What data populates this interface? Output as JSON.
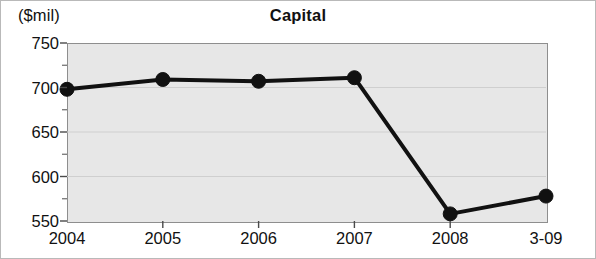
{
  "figure": {
    "unit_label": "($mil)",
    "title": "Capital",
    "width": 596,
    "height": 259,
    "frame_color": "#b9b9b9",
    "plot_background": "#e7e7e7",
    "plot_border_color": "#8e8e8e",
    "gridline_color": "#cfcfcf",
    "series_color": "#111111"
  },
  "chart_data": {
    "type": "line",
    "title": "Capital",
    "xlabel": "",
    "ylabel": "($mil)",
    "categories": [
      "2004",
      "2005",
      "2006",
      "2007",
      "2008",
      "3-09"
    ],
    "values": [
      698,
      709,
      707,
      711,
      558,
      578
    ],
    "series": [
      {
        "name": "Capital",
        "values": [
          698,
          709,
          707,
          711,
          558,
          578
        ]
      }
    ],
    "ylim": [
      550,
      750
    ],
    "yticks": [
      550,
      600,
      650,
      700,
      750
    ],
    "ytick_labels": [
      "550",
      "600",
      "650",
      "700",
      "750"
    ],
    "yminor_ticks": [
      575,
      625,
      675,
      725
    ],
    "grid": true,
    "grid_axis": "y",
    "legend": false,
    "legend_position": "none",
    "marker": "circle",
    "marker_filled": true,
    "line_width_px": 4
  }
}
